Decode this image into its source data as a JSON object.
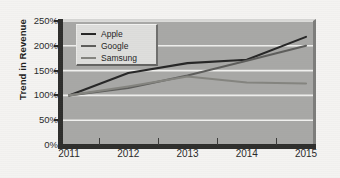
{
  "figure": {
    "background_color": "#f4f3f1",
    "plot_background_color": "#a8a8a6"
  },
  "axes": {
    "y_title": "Trend in Revenue",
    "y_tick_labels": [
      "250%",
      "200%",
      "150%",
      "100%",
      "50%",
      "0%"
    ],
    "x_tick_labels": [
      "2011",
      "2012",
      "2013",
      "2014",
      "2015"
    ]
  },
  "legend": {
    "entries": [
      {
        "label": "Apple",
        "color": "#262626"
      },
      {
        "label": "Google",
        "color": "#5d5d5b"
      },
      {
        "label": "Samsung",
        "color": "#84847f"
      }
    ]
  },
  "chart_data": {
    "type": "line",
    "title": "",
    "xlabel": "",
    "ylabel": "Trend in Revenue",
    "categories": [
      "2011",
      "2012",
      "2013",
      "2014",
      "2015"
    ],
    "x": [
      2011,
      2012,
      2013,
      2014,
      2015
    ],
    "series": [
      {
        "name": "Apple",
        "color": "#262626",
        "values": [
          100,
          145,
          165,
          172,
          218
        ]
      },
      {
        "name": "Google",
        "color": "#5d5d5b",
        "values": [
          100,
          115,
          140,
          170,
          200
        ]
      },
      {
        "name": "Samsung",
        "color": "#84847f",
        "values": [
          100,
          118,
          138,
          126,
          124
        ]
      }
    ],
    "ylim": [
      0,
      250
    ],
    "y_ticks": [
      0,
      50,
      100,
      150,
      200,
      250
    ],
    "y_tick_labels": [
      "0%",
      "50%",
      "100%",
      "150%",
      "200%",
      "250%"
    ],
    "y_unit": "%",
    "grid": true,
    "grid_axis": "y",
    "grid_color": "#f0f0ee",
    "legend_position": "upper left"
  }
}
